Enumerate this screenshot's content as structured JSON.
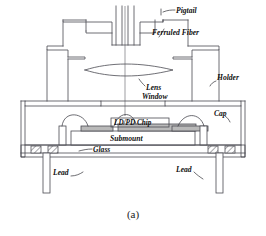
{
  "figure": {
    "caption": "(a)",
    "caption_name": "figure-caption-a"
  },
  "labels": {
    "pigtail": "Pigtail",
    "ferruled_fiber": "Ferruled Fiber",
    "holder": "Holder",
    "lens": "Lens",
    "window": "Window",
    "cap": "Cap",
    "chip": "LD/PD Chip",
    "submount": "Submount",
    "glass": "Glass",
    "lead_left": "Lead",
    "lead_right": "Lead"
  },
  "colors": {
    "line": "#4a4a52",
    "leader": "#2f2f35",
    "chip_fill": "#b9b9b9",
    "background": "#ffffff",
    "text": "#101010"
  },
  "parts": [
    {
      "name": "pigtail",
      "label": "Pigtail"
    },
    {
      "name": "ferruled-fiber",
      "label": "Ferruled Fiber"
    },
    {
      "name": "holder",
      "label": "Holder"
    },
    {
      "name": "lens",
      "label": "Lens"
    },
    {
      "name": "window",
      "label": "Window"
    },
    {
      "name": "cap",
      "label": "Cap"
    },
    {
      "name": "ld-pd-chip",
      "label": "LD/PD Chip"
    },
    {
      "name": "submount",
      "label": "Submount"
    },
    {
      "name": "glass",
      "label": "Glass"
    },
    {
      "name": "lead",
      "label": "Lead"
    }
  ]
}
